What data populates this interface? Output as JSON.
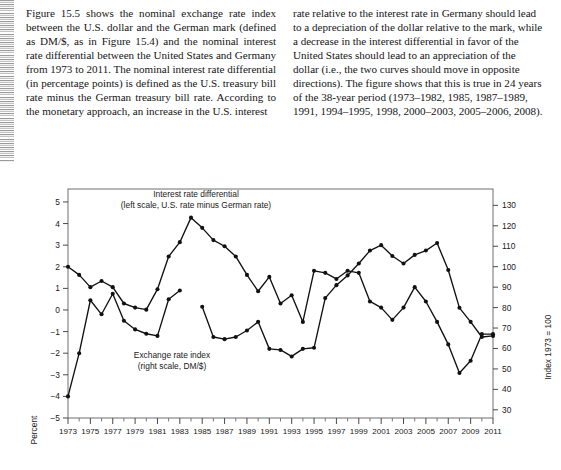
{
  "document": {
    "body_text": {
      "column_left": "Figure 15.5 shows the nominal exchange rate index between the U.S. dollar and the German mark (defined as DM/$, as in Figure 15.4) and the nominal interest rate differential between the United States and Germany from 1973 to 2011. The nominal interest rate differential (in percentage points) is defined as the U.S. treasury bill rate minus the German treasury bill rate. According to the monetary approach, an increase in the U.S. interest",
      "column_right": "rate relative to the interest rate in Germany should lead to a depreciation of the dollar relative to the mark, while a decrease in the interest differential in favor of the United States should lead to an appreciation of the dollar (i.e., the two curves should move in opposite directions). The figure shows that this is true in 24 years of the 38-year period (1973–1982, 1985, 1987–1989, 1991, 1994–1995, 1998, 2000–2003, 2005–2006, 2008)."
    }
  },
  "chart_data": {
    "type": "line",
    "title": "",
    "xlabel": "",
    "ylabel": "Percent",
    "y2label": "Index 1973 = 100",
    "grid": false,
    "legend_position": "inline-annotations",
    "ylim": [
      -5,
      5.6
    ],
    "y2lim": [
      26,
      138
    ],
    "yticks": [
      5,
      4,
      3,
      2,
      1,
      0,
      -1,
      -2,
      -3,
      -4,
      -5
    ],
    "ytick_labels": [
      "5",
      "4",
      "3",
      "2",
      "1",
      "0",
      "−1",
      "−2",
      "−3",
      "−4",
      "−5"
    ],
    "y2ticks": [
      130,
      120,
      110,
      100,
      90,
      80,
      70,
      60,
      50,
      40,
      30
    ],
    "y2tick_labels": [
      "130",
      "120",
      "110",
      "100",
      "90",
      "80",
      "70",
      "60",
      "50",
      "40",
      "30"
    ],
    "xlim": [
      1973,
      2011
    ],
    "x": [
      1973,
      1974,
      1975,
      1976,
      1977,
      1978,
      1979,
      1980,
      1981,
      1982,
      1983,
      1984,
      1985,
      1986,
      1987,
      1988,
      1989,
      1990,
      1991,
      1992,
      1993,
      1994,
      1995,
      1996,
      1997,
      1998,
      1999,
      2000,
      2001,
      2002,
      2003,
      2004,
      2005,
      2006,
      2007,
      2008,
      2009,
      2010,
      2011
    ],
    "xtick_labels": [
      "1973",
      "1975",
      "1977",
      "1979",
      "1981",
      "1983",
      "1985",
      "1987",
      "1989",
      "1991",
      "1993",
      "1995",
      "1997",
      "1999",
      "2001",
      "2003",
      "2005",
      "2007",
      "2009",
      "2011"
    ],
    "annotations": [
      {
        "name": "interest-differential-label",
        "line1": "Interest rate differential",
        "line2": "(left scale, U.S. rate minus German rate)"
      },
      {
        "name": "exchange-rate-label",
        "line1": "Exchange rate index",
        "line2": "(right scale, DM/$)"
      }
    ],
    "series": [
      {
        "name": "Interest rate differential",
        "axis": "left",
        "units": "percentage points",
        "values": [
          -4.0,
          -2.0,
          0.45,
          -0.2,
          0.75,
          -0.5,
          -0.9,
          -1.1,
          -1.2,
          0.5,
          0.9,
          null,
          0.15,
          -1.25,
          -1.35,
          -1.25,
          -0.95,
          -0.55,
          -1.8,
          -1.85,
          -2.15,
          -1.8,
          -1.75,
          0.55,
          1.15,
          1.6,
          2.15,
          2.75,
          3.0,
          2.5,
          2.15,
          2.55,
          2.75,
          3.1,
          1.85,
          0.1,
          -0.55,
          -1.25,
          -1.2
        ]
      },
      {
        "name": "Exchange rate index",
        "axis": "right",
        "units": "index 1973 = 100",
        "values": [
          100,
          96,
          90,
          93,
          90,
          82,
          80,
          79,
          89,
          105,
          112,
          124,
          119,
          113,
          110,
          105,
          96,
          88,
          95,
          82,
          86,
          73,
          98,
          97,
          94,
          98,
          97,
          83,
          80,
          74,
          80,
          90,
          83,
          73,
          62,
          48,
          54,
          67,
          67
        ]
      }
    ]
  },
  "figure": {
    "y_axis_title": "Percent",
    "y2_axis_title": "Index 1973 = 100"
  }
}
